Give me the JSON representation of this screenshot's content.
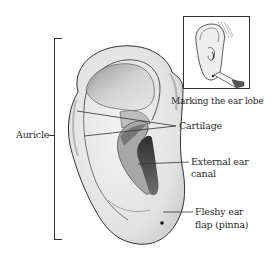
{
  "diagram": {
    "labels": {
      "auricle": "Auricle",
      "cartilage": "Cartilage",
      "external_canal_line1": "External ear",
      "external_canal_line2": "canal",
      "pinna_line1": "Fleshy ear",
      "pinna_line2": "flap (pinna)"
    },
    "inset": {
      "caption": "Marking the ear lobe",
      "depicts": "ear with a marker pen marking the lobe"
    },
    "colors": {
      "background": "#ffffff",
      "line": "#333333",
      "ear_fill": "#e6e6e6",
      "shadow": "#6a6a6a",
      "dark_canal": "#3a3a3a"
    }
  }
}
